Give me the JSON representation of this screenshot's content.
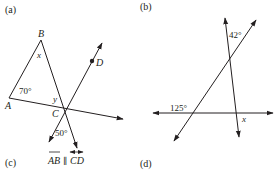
{
  "panels": [
    {
      "id": "a",
      "label": "(a)",
      "points": {
        "A": "A",
        "B": "B",
        "C": "C",
        "D": "D"
      },
      "angles": {
        "at_A": "70°",
        "at_B": "x",
        "at_C_interior": "y",
        "at_C_below": "50°"
      }
    },
    {
      "id": "b",
      "label": "(b)",
      "angles": {
        "top": "42°",
        "left": "125°",
        "right_lower": "x"
      }
    }
  ],
  "captions": {
    "c": "(c)",
    "c_condition_left": "AB",
    "c_condition_parallel": "∥",
    "c_condition_right": "CD",
    "d": "(d)"
  },
  "colors": {
    "ink": "#231f20",
    "background": "#ffffff"
  }
}
